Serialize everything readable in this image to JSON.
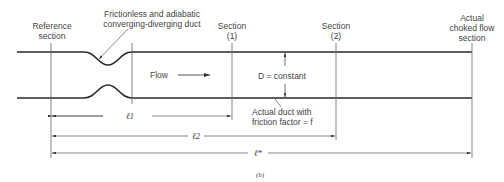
{
  "figure": {
    "caption": "(b)",
    "labels": {
      "reference_section": [
        "Reference",
        "section"
      ],
      "nozzle": [
        "Frictionless and adiabatic",
        "converging-diverging duct"
      ],
      "section1": [
        "Section",
        "(1)"
      ],
      "section2": [
        "Section",
        "(2)"
      ],
      "choked": [
        "Actual",
        "choked flow",
        "section"
      ],
      "flow": "Flow",
      "diameter": "D = constant",
      "duct": [
        "Actual duct with",
        "friction factor = f"
      ],
      "l1": "ℓ1",
      "l2": "ℓ2",
      "lstar": "ℓ*"
    },
    "colors": {
      "line": "#2a2a2a",
      "thin": "#555555"
    }
  }
}
